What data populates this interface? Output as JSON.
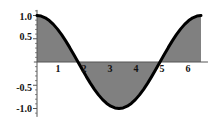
{
  "figure": {
    "background_color": "#ffffff",
    "fill_color": "#808080",
    "curve_color": "#000000",
    "axis_color": "#555555",
    "label_color": "#111111"
  },
  "chart_data": {
    "type": "area",
    "title": "",
    "xlabel": "",
    "ylabel": "",
    "xlim": [
      -0.12,
      6.55
    ],
    "ylim": [
      -1.18,
      1.12
    ],
    "grid": false,
    "legend": null,
    "fill": "between-curve-and-zero",
    "x_ticks": [
      {
        "value": 1,
        "label": "1"
      },
      {
        "value": 2,
        "label": "2"
      },
      {
        "value": 3,
        "label": "3"
      },
      {
        "value": 4,
        "label": "4"
      },
      {
        "value": 5,
        "label": "5"
      },
      {
        "value": 6,
        "label": "6"
      }
    ],
    "y_ticks": [
      {
        "value": 1.0,
        "label": "1.0"
      },
      {
        "value": 0.5,
        "label": "0.5"
      },
      {
        "value": -0.5,
        "label": "-0.5"
      },
      {
        "value": -1.0,
        "label": "-1.0"
      }
    ],
    "x_minor_tick_step": 0.2,
    "y_minor_tick_step": 0.1,
    "series": [
      {
        "name": "cos(x)",
        "function": "cos",
        "x_start": 0,
        "x_end": 6.2832,
        "x": [
          0.0,
          0.1571,
          0.3142,
          0.4712,
          0.6283,
          0.7854,
          0.9425,
          1.0996,
          1.2566,
          1.4137,
          1.5708,
          1.7279,
          1.885,
          2.042,
          2.1991,
          2.3562,
          2.5133,
          2.6704,
          2.8274,
          2.9845,
          3.1416,
          3.2987,
          3.4558,
          3.6128,
          3.7699,
          3.927,
          4.0841,
          4.2412,
          4.3982,
          4.5553,
          4.7124,
          4.8695,
          5.0265,
          5.1836,
          5.3407,
          5.4978,
          5.6549,
          5.8119,
          5.969,
          6.1261,
          6.2832
        ],
        "values": [
          1.0,
          0.9877,
          0.9511,
          0.891,
          0.809,
          0.7071,
          0.5878,
          0.454,
          0.309,
          0.1564,
          0.0,
          -0.1564,
          -0.309,
          -0.454,
          -0.5878,
          -0.7071,
          -0.809,
          -0.891,
          -0.9511,
          -0.9877,
          -1.0,
          -0.9877,
          -0.9511,
          -0.891,
          -0.809,
          -0.7071,
          -0.5878,
          -0.454,
          -0.309,
          -0.1564,
          0.0,
          0.1564,
          0.309,
          0.454,
          0.5878,
          0.7071,
          0.809,
          0.891,
          0.9511,
          0.9877,
          1.0
        ]
      }
    ]
  },
  "labels": {
    "y": [
      "1.0",
      "0.5",
      "-0.5",
      "-1.0"
    ],
    "x": [
      "1",
      "2",
      "3",
      "4",
      "5",
      "6"
    ]
  }
}
